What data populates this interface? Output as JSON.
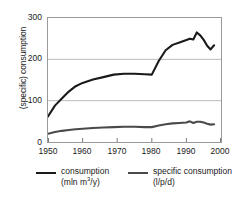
{
  "chart_data": {
    "type": "line",
    "title": "",
    "subtitle": "",
    "xlabel": "",
    "ylabel": "(specific) consumption",
    "xlim": [
      1950,
      2000
    ],
    "ylim": [
      0,
      300
    ],
    "xticks": [
      1950,
      1960,
      1970,
      1980,
      1990,
      2000
    ],
    "yticks": [
      0,
      100,
      200,
      300
    ],
    "grid": "horizontal",
    "legend_position": "bottom",
    "series": [
      {
        "name": "consumption",
        "unit": "(mln m³/y)",
        "color": "#1a1a1a",
        "line_width": 2.1,
        "x": [
          1950,
          1952,
          1954,
          1956,
          1958,
          1960,
          1963,
          1966,
          1969,
          1972,
          1975,
          1978,
          1980,
          1982,
          1984,
          1986,
          1988,
          1990,
          1991,
          1992,
          1993,
          1994,
          1995,
          1996,
          1997,
          1998
        ],
        "values": [
          62,
          88,
          105,
          122,
          135,
          143,
          151,
          157,
          163,
          165,
          165,
          164,
          163,
          196,
          222,
          235,
          241,
          247,
          250,
          248,
          265,
          258,
          247,
          233,
          224,
          234
        ]
      },
      {
        "name": "specific consumption",
        "unit": "(l/p/d)",
        "color": "#4a4a4a",
        "line_width": 2.1,
        "x": [
          1950,
          1952,
          1954,
          1956,
          1958,
          1960,
          1963,
          1966,
          1969,
          1972,
          1975,
          1978,
          1980,
          1982,
          1984,
          1986,
          1988,
          1990,
          1991,
          1992,
          1993,
          1994,
          1995,
          1996,
          1997,
          1998
        ],
        "values": [
          20,
          24,
          27,
          29,
          31,
          32,
          34,
          35,
          36,
          37,
          37,
          36,
          36,
          40,
          43,
          45,
          46,
          47,
          50,
          46,
          49,
          49,
          47,
          44,
          42,
          43
        ]
      }
    ]
  },
  "axis": {
    "ylabel": "(specific) consumption",
    "yticks": [
      "300",
      "200",
      "100",
      "0"
    ],
    "xticks": [
      "1950",
      "1960",
      "1970",
      "1980",
      "1990",
      "2000"
    ]
  },
  "legend": {
    "entries": [
      {
        "label": "consumption",
        "unit_prefix": "(mln m",
        "unit_sup": "3",
        "unit_suffix": "/y)",
        "color": "#1a1a1a"
      },
      {
        "label": "specific consumption",
        "unit_prefix": "(l/p/d)",
        "unit_sup": "",
        "unit_suffix": "",
        "color": "#4a4a4a"
      }
    ]
  }
}
